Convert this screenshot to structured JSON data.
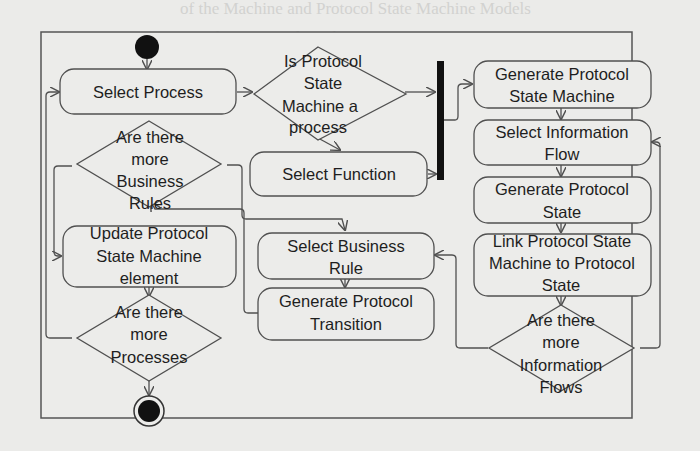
{
  "diagram": {
    "type": "uml-activity-diagram",
    "background_text_lines": [
      "of the Machine and Protocol State Machine Models",
      "transformation Algorithms",
      "",
      "The State Machine proposed by",
      "",
      "",
      "",
      "",
      "",
      "",
      "",
      "",
      "",
      "",
      ""
    ],
    "nodes": {
      "start": {
        "kind": "initial"
      },
      "select_process": {
        "kind": "action",
        "lines": [
          "Select Process"
        ]
      },
      "is_psm_process": {
        "kind": "decision",
        "lines": [
          "Is Protocol",
          "State",
          "Machine a",
          "process"
        ]
      },
      "fork_bar": {
        "kind": "fork"
      },
      "select_function": {
        "kind": "action",
        "lines": [
          "Select Function"
        ]
      },
      "more_business_rules": {
        "kind": "decision",
        "lines": [
          "Are there",
          "more",
          "Business",
          "Rules"
        ]
      },
      "update_psm_element": {
        "kind": "action",
        "lines": [
          "Update Protocol",
          "State Machine",
          "element"
        ]
      },
      "more_processes": {
        "kind": "decision",
        "lines": [
          "Are there",
          "more",
          "Processes"
        ]
      },
      "end": {
        "kind": "final"
      },
      "select_business_rule": {
        "kind": "action",
        "lines": [
          "Select Business",
          "Rule"
        ]
      },
      "generate_protocol_transition": {
        "kind": "action",
        "lines": [
          "Generate Protocol",
          "Transition"
        ]
      },
      "generate_psm": {
        "kind": "action",
        "lines": [
          "Generate Protocol",
          "State Machine"
        ]
      },
      "select_information_flow": {
        "kind": "action",
        "lines": [
          "Select Information",
          "Flow"
        ]
      },
      "generate_protocol_state": {
        "kind": "action",
        "lines": [
          "Generate Protocol",
          "State"
        ]
      },
      "link_psm_to_state": {
        "kind": "action",
        "lines": [
          "Link Protocol State",
          "Machine to Protocol",
          "State"
        ]
      },
      "more_information_flows": {
        "kind": "decision",
        "lines": [
          "Are there",
          "more",
          "Information",
          "Flows"
        ]
      }
    },
    "edges": [
      [
        "start",
        "select_process"
      ],
      [
        "select_process",
        "is_psm_process"
      ],
      [
        "is_psm_process",
        "fork_bar"
      ],
      [
        "is_psm_process",
        "select_function"
      ],
      [
        "select_function",
        "fork_bar"
      ],
      [
        "fork_bar",
        "generate_psm"
      ],
      [
        "generate_psm",
        "select_information_flow"
      ],
      [
        "select_information_flow",
        "generate_protocol_state"
      ],
      [
        "generate_protocol_state",
        "link_psm_to_state"
      ],
      [
        "link_psm_to_state",
        "more_information_flows"
      ],
      [
        "more_information_flows",
        "select_information_flow"
      ],
      [
        "more_information_flows",
        "select_business_rule"
      ],
      [
        "select_business_rule",
        "generate_protocol_transition"
      ],
      [
        "generate_protocol_transition",
        "more_business_rules"
      ],
      [
        "more_business_rules",
        "select_business_rule"
      ],
      [
        "more_business_rules",
        "update_psm_element"
      ],
      [
        "update_psm_element",
        "more_processes"
      ],
      [
        "more_processes",
        "select_process"
      ],
      [
        "more_processes",
        "end"
      ]
    ],
    "colors": {
      "stroke": "#505050",
      "fill": "#ececea",
      "text": "#1e1e1e",
      "solid": "#111111"
    }
  }
}
